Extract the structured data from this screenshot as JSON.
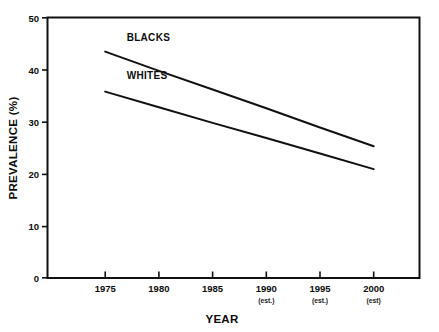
{
  "chart_data": {
    "type": "line",
    "title": "",
    "xlabel": "YEAR",
    "ylabel": "PREVALENCE (%)",
    "x": [
      1975,
      1980,
      1985,
      1990,
      1995,
      2000
    ],
    "categories": [
      "1975",
      "1980",
      "1985",
      "1990",
      "1995",
      "2000"
    ],
    "xtick_sublabels": [
      "",
      "",
      "",
      "(est.)",
      "(est.)",
      "(est)"
    ],
    "xlim": [
      1972,
      2003
    ],
    "ylim": [
      0,
      50
    ],
    "yticks": [
      0,
      10,
      20,
      30,
      40,
      50
    ],
    "ytick_labels": [
      "0",
      "10",
      "20",
      "30",
      "40",
      "50"
    ],
    "grid": false,
    "legend_position": "inline-labels",
    "series": [
      {
        "name": "BLACKS",
        "values": [
          43.5,
          39.8,
          36.2,
          32.6,
          28.9,
          25.3
        ],
        "x": [
          1975,
          1980,
          1985,
          1990,
          1995,
          2000
        ],
        "color": "#111111",
        "label_x": 1977.0,
        "label_y": 45.6
      },
      {
        "name": "WHITES",
        "values": [
          35.8,
          32.8,
          29.8,
          26.9,
          23.9,
          20.9
        ],
        "x": [
          1975,
          1980,
          1985,
          1990,
          1995,
          2000
        ],
        "color": "#111111",
        "label_x": 1977.0,
        "label_y": 38.2
      }
    ],
    "annotations": [
      {
        "text": "BLACKS",
        "x": 1977.0,
        "y": 45.6
      },
      {
        "text": "WHITES",
        "x": 1977.0,
        "y": 38.2
      }
    ]
  },
  "axes": {
    "y_title": "PREVALENCE (%)",
    "x_title": "YEAR",
    "y_ticks": [
      {
        "value": 50,
        "label": "50"
      },
      {
        "value": 40,
        "label": "40"
      },
      {
        "value": 30,
        "label": "30"
      },
      {
        "value": 20,
        "label": "20"
      },
      {
        "value": 10,
        "label": "10"
      },
      {
        "value": 0,
        "label": "0"
      }
    ],
    "x_ticks": [
      {
        "value": 1975,
        "label": "1975",
        "sub": ""
      },
      {
        "value": 1980,
        "label": "1980",
        "sub": ""
      },
      {
        "value": 1985,
        "label": "1985",
        "sub": ""
      },
      {
        "value": 1990,
        "label": "1990",
        "sub": "(est.)"
      },
      {
        "value": 1995,
        "label": "1995",
        "sub": "(est.)"
      },
      {
        "value": 2000,
        "label": "2000",
        "sub": "(est)"
      }
    ]
  },
  "colors": {
    "background": "#ffffff",
    "frame": "#111111",
    "line": "#111111",
    "text": "#0d0d0d"
  }
}
